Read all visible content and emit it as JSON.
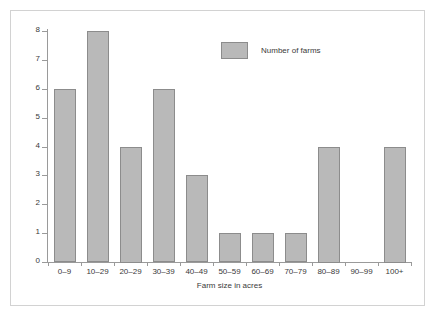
{
  "chart_data": {
    "type": "bar",
    "title": "",
    "subtitle": "",
    "xlabel": "Farm size in acres",
    "ylabel": "",
    "categories": [
      "0–9",
      "10–29",
      "20–29",
      "30–39",
      "40–49",
      "50–59",
      "60–69",
      "70–79",
      "80–89",
      "90–99",
      "100+"
    ],
    "values": [
      6,
      8,
      4,
      6,
      3,
      1,
      1,
      1,
      4,
      0,
      4
    ],
    "series": [
      {
        "name": "Number of farms",
        "values": [
          6,
          8,
          4,
          6,
          3,
          1,
          1,
          1,
          4,
          0,
          4
        ]
      }
    ],
    "ylim": [
      0,
      8
    ],
    "y_ticks": [
      "0",
      "1",
      "2",
      "3",
      "4",
      "5",
      "6",
      "7",
      "8"
    ],
    "grid": false,
    "legend_position": "top-right",
    "legend_entries": [
      "Number of farms"
    ],
    "bar_color": "#b9b9b9",
    "bar_border_color": "#8c8c8c",
    "axis_color": "#9a9a9a",
    "text_color": "#3a3a3a",
    "frame_color": "#d2d2d2",
    "background": "#ffffff"
  },
  "legend": {
    "label": "Number of farms"
  },
  "axes": {
    "x_title": "Farm size in acres"
  }
}
